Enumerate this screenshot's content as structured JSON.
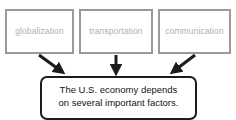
{
  "diagram": {
    "type": "concept-map",
    "background_color": "#ffffff",
    "factor_box_border_color": "#9a9a9a",
    "factor_label_color": "#b0b0b0",
    "conclusion_border_color": "#1c1c1c",
    "conclusion_text_color": "#141414",
    "arrow_color": "#1c1c1c",
    "factors": [
      {
        "label": "globalization"
      },
      {
        "label": "transportation"
      },
      {
        "label": "communication"
      }
    ],
    "conclusion": {
      "line1": "The U.S. economy depends",
      "line2": "on several important factors."
    },
    "arrows": [
      {
        "name": "arrow-globalization-to-conclusion",
        "direction": "down-right"
      },
      {
        "name": "arrow-transportation-to-conclusion",
        "direction": "down"
      },
      {
        "name": "arrow-communication-to-conclusion",
        "direction": "down-left"
      }
    ]
  }
}
